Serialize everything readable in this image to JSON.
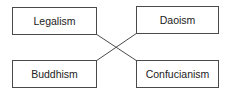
{
  "diagram": {
    "type": "matching-crossed-lines",
    "nodes": [
      {
        "id": "legalism",
        "label": "Legalism",
        "position": "top-left"
      },
      {
        "id": "daoism",
        "label": "Daoism",
        "position": "top-right"
      },
      {
        "id": "buddhism",
        "label": "Buddhism",
        "position": "bottom-left"
      },
      {
        "id": "confucianism",
        "label": "Confucianism",
        "position": "bottom-right"
      }
    ],
    "edges": [
      {
        "from": "legalism",
        "to": "confucianism"
      },
      {
        "from": "buddhism",
        "to": "daoism"
      }
    ],
    "colors": {
      "border": "#4a4a4a",
      "line": "#4a4a4a",
      "text": "#222222",
      "background": "#ffffff"
    }
  }
}
